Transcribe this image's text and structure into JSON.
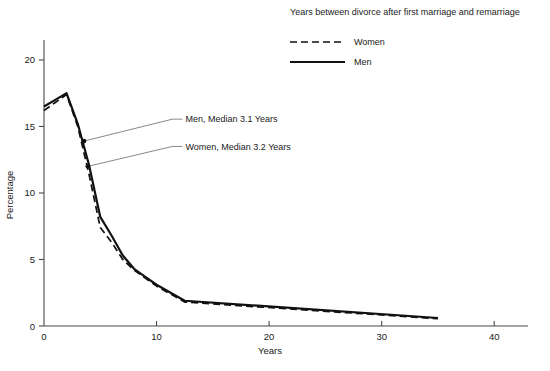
{
  "chart_data": {
    "type": "line",
    "title": "",
    "legend_title": "Years between divorce after first marriage and remarriage",
    "legend_position": "top-right",
    "xlabel": "Years",
    "ylabel": "Percentage",
    "xlim": [
      0,
      43
    ],
    "ylim": [
      0,
      21.5
    ],
    "xticks": [
      0,
      10,
      20,
      30,
      40
    ],
    "xtick_labels": [
      "0",
      "10",
      "20",
      "30",
      "40"
    ],
    "yticks": [
      0,
      5,
      10,
      15,
      20
    ],
    "ytick_labels": [
      "0",
      "5",
      "10",
      "15",
      "20"
    ],
    "grid": false,
    "series": [
      {
        "name": "Women",
        "style": "dashed",
        "x": [
          0,
          1,
          2,
          3,
          4,
          5,
          6,
          7,
          8,
          9,
          10,
          12.5,
          35
        ],
        "values": [
          16.2,
          16.8,
          17.4,
          15.0,
          11.4,
          7.4,
          6.3,
          5.0,
          4.2,
          3.6,
          3.0,
          1.8,
          0.55
        ]
      },
      {
        "name": "Men",
        "style": "solid",
        "x": [
          0,
          1,
          2,
          3,
          4,
          5,
          6,
          7,
          8,
          9,
          10,
          12.5,
          35
        ],
        "values": [
          16.5,
          17.0,
          17.5,
          15.2,
          12.1,
          8.2,
          6.8,
          5.3,
          4.3,
          3.7,
          3.1,
          1.9,
          0.6
        ]
      }
    ],
    "annotations": [
      {
        "label": "Men, Median 3.1 Years",
        "point_x": 3.55,
        "point_y": 13.9,
        "text_x": 12.3,
        "text_y": 15.55
      },
      {
        "label": "Women, Median 3.2 Years",
        "point_x": 3.9,
        "point_y": 12.0,
        "text_x": 12.3,
        "text_y": 13.5
      }
    ],
    "colors": {
      "line": "#111111",
      "axis": "#4a4a4a",
      "text": "#1a1a1a",
      "background": "#ffffff"
    }
  }
}
